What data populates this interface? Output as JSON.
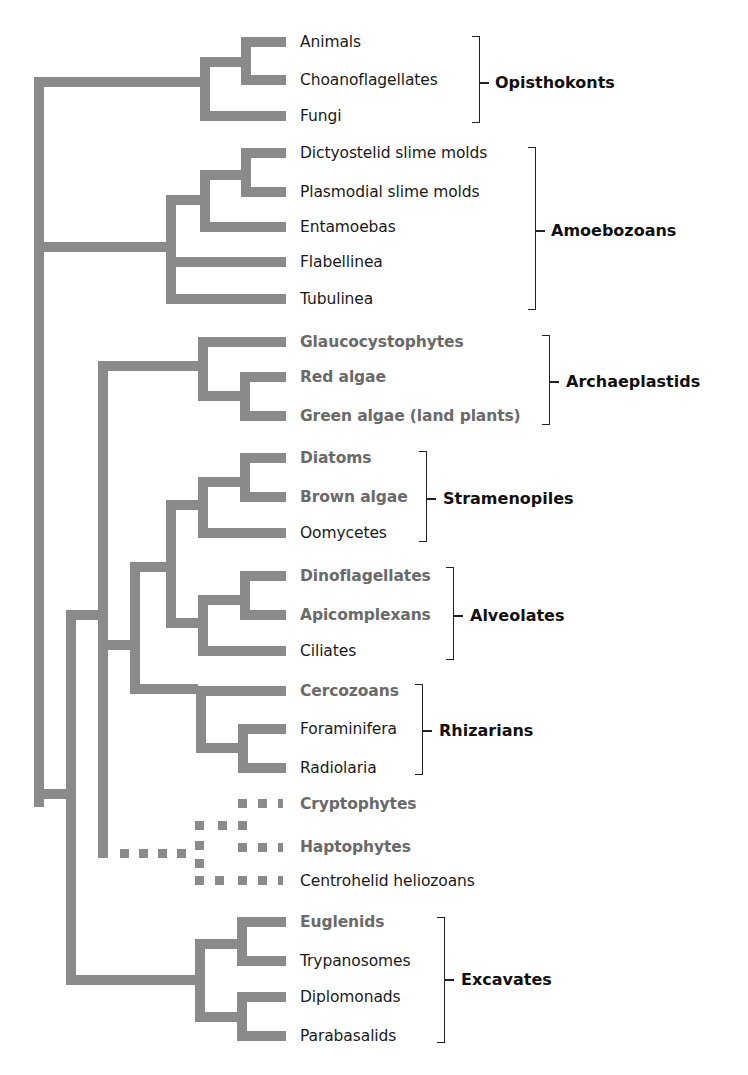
{
  "diagram": {
    "type": "phylogenetic-tree",
    "branch_color": "#8a8a8a",
    "highlight_text_color": "#6a6a6a",
    "legend_note": "Gray bold taxa are photosynthetic lineages; dotted branches indicate uncertain placement"
  },
  "leaves": [
    {
      "label": "Animals",
      "highlight": false
    },
    {
      "label": "Choanoflagellates",
      "highlight": false
    },
    {
      "label": "Fungi",
      "highlight": false
    },
    {
      "label": "Dictyostelid slime molds",
      "highlight": false
    },
    {
      "label": "Plasmodial slime molds",
      "highlight": false
    },
    {
      "label": "Entamoebas",
      "highlight": false
    },
    {
      "label": "Flabellinea",
      "highlight": false
    },
    {
      "label": "Tubulinea",
      "highlight": false
    },
    {
      "label": "Glaucocystophytes",
      "highlight": true
    },
    {
      "label": "Red algae",
      "highlight": true
    },
    {
      "label": "Green algae (land plants)",
      "highlight": true
    },
    {
      "label": "Diatoms",
      "highlight": true
    },
    {
      "label": "Brown algae",
      "highlight": true
    },
    {
      "label": "Oomycetes",
      "highlight": false
    },
    {
      "label": "Dinoflagellates",
      "highlight": true
    },
    {
      "label": "Apicomplexans",
      "highlight": true
    },
    {
      "label": "Ciliates",
      "highlight": false
    },
    {
      "label": "Cercozoans",
      "highlight": true
    },
    {
      "label": "Foraminifera",
      "highlight": false
    },
    {
      "label": "Radiolaria",
      "highlight": false
    },
    {
      "label": "Cryptophytes",
      "highlight": true
    },
    {
      "label": "Haptophytes",
      "highlight": true
    },
    {
      "label": "Centrohelid heliozoans",
      "highlight": false
    },
    {
      "label": "Euglenids",
      "highlight": true
    },
    {
      "label": "Trypanosomes",
      "highlight": false
    },
    {
      "label": "Diplomonads",
      "highlight": false
    },
    {
      "label": "Parabasalids",
      "highlight": false
    }
  ],
  "groups": [
    {
      "label": "Opisthokonts",
      "members": [
        "Animals",
        "Choanoflagellates",
        "Fungi"
      ]
    },
    {
      "label": "Amoebozoans",
      "members": [
        "Dictyostelid slime molds",
        "Plasmodial slime molds",
        "Entamoebas",
        "Flabellinea",
        "Tubulinea"
      ]
    },
    {
      "label": "Archaeplastids",
      "members": [
        "Glaucocystophytes",
        "Red algae",
        "Green algae (land plants)"
      ]
    },
    {
      "label": "Stramenopiles",
      "members": [
        "Diatoms",
        "Brown algae",
        "Oomycetes"
      ]
    },
    {
      "label": "Alveolates",
      "members": [
        "Dinoflagellates",
        "Apicomplexans",
        "Ciliates"
      ]
    },
    {
      "label": "Rhizarians",
      "members": [
        "Cercozoans",
        "Foraminifera",
        "Radiolaria"
      ]
    },
    {
      "label": "Excavates",
      "members": [
        "Euglenids",
        "Trypanosomes",
        "Diplomonads",
        "Parabasalids"
      ]
    }
  ]
}
